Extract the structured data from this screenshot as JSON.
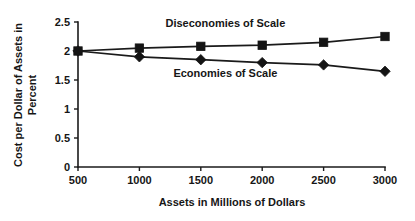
{
  "chart_data": {
    "type": "line",
    "title": "",
    "xlabel": "Assets in Millions of Dollars",
    "ylabel": "Cost per Dollar of Assets in Percent",
    "ylabel_line1": "Cost per Dollar of Assets in",
    "ylabel_line2": "Percent",
    "x": [
      500,
      1000,
      1500,
      2000,
      2500,
      3000
    ],
    "categories": [
      "500",
      "1000",
      "1500",
      "2000",
      "2500",
      "3000"
    ],
    "xtick_labels": [
      "500",
      "1000",
      "1500",
      "2000",
      "2500",
      "3000"
    ],
    "ytick_labels": [
      "0",
      "0.5",
      "1",
      "1.5",
      "2",
      "2.5"
    ],
    "ytick_values": [
      0,
      0.5,
      1,
      1.5,
      2,
      2.5
    ],
    "xlim": [
      500,
      3000
    ],
    "ylim": [
      0,
      2.5
    ],
    "grid": false,
    "legend_position": "inline-annotations",
    "series": [
      {
        "name": "Diseconomies of Scale",
        "marker": "square",
        "color": "#141414",
        "values": [
          2.0,
          2.05,
          2.08,
          2.1,
          2.15,
          2.25
        ],
        "annotation": {
          "text": "Diseconomies of Scale",
          "x": 1700,
          "y": 2.42
        }
      },
      {
        "name": "Economies of Scale",
        "marker": "diamond",
        "color": "#141414",
        "values": [
          2.0,
          1.9,
          1.85,
          1.8,
          1.76,
          1.65
        ],
        "annotation": {
          "text": "Economies of Scale",
          "x": 1700,
          "y": 1.55
        }
      }
    ],
    "colors": {
      "axis": "#1a1a1a",
      "text": "#161616",
      "series": "#141414",
      "background": "#ffffff"
    }
  }
}
